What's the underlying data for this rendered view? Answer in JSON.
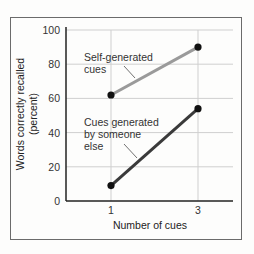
{
  "chart_data": {
    "type": "line",
    "title": "",
    "xlabel": "Number of cues",
    "ylabel": [
      "Words correctly recalled",
      "(percent)"
    ],
    "x": [
      1,
      3
    ],
    "x_ticks": [
      "1",
      "3"
    ],
    "ylim": [
      0,
      100
    ],
    "y_ticks": [
      "0",
      "20",
      "40",
      "60",
      "80",
      "100"
    ],
    "grid": true,
    "legend": "inline annotations",
    "series": [
      {
        "name": "Self-generated cues",
        "annotation": [
          "Self-generated",
          "cues"
        ],
        "values": [
          62,
          90
        ],
        "color": "#9a9a9a"
      },
      {
        "name": "Cues generated by someone else",
        "annotation": [
          "Cues generated",
          "by someone",
          "else"
        ],
        "values": [
          9,
          54
        ],
        "color": "#3a3a3a"
      }
    ],
    "colors": {
      "frame": "#6b6b6b",
      "grid": "#cfcfcf",
      "axis": "#222222",
      "marker": "#111111"
    }
  }
}
